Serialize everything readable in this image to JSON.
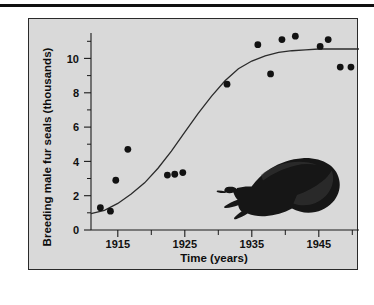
{
  "page": {
    "background_color": "#ffffff",
    "top_rule_color": "#101010",
    "panel_background": "#d9d9d9",
    "panel_border_color": "#2a2a2a"
  },
  "figure": {
    "name": "fur-seal-population-growth-figure",
    "decoration_label": "fur-seal-silhouette"
  },
  "chart_data": {
    "type": "scatter",
    "title": "",
    "subtitle": "",
    "xlabel": "Time (years)",
    "ylabel": "Breeding male fur seals (thousands)",
    "xlim": [
      1911,
      1951
    ],
    "ylim": [
      0,
      11.6
    ],
    "grid": false,
    "legend": null,
    "x_major_ticks": [
      1915,
      1925,
      1935,
      1945
    ],
    "x_major_tick_labels": [
      "1915",
      "1925",
      "1935",
      "1945"
    ],
    "x_minor_ticks": [
      1920,
      1930,
      1940,
      1950
    ],
    "y_major_ticks": [
      0,
      2,
      4,
      6,
      8,
      10
    ],
    "y_major_tick_labels": [
      "0",
      "2",
      "4",
      "6",
      "8",
      "10"
    ],
    "y_minor_ticks": [
      1,
      3,
      5,
      7,
      9,
      11
    ],
    "series": [
      {
        "name": "Breeding male fur seals (observed)",
        "type": "scatter",
        "marker": "filled-circle",
        "color": "#121212",
        "points": [
          {
            "x": 1912.4,
            "y": 1.3
          },
          {
            "x": 1913.9,
            "y": 1.1
          },
          {
            "x": 1914.7,
            "y": 2.9
          },
          {
            "x": 1916.5,
            "y": 4.7
          },
          {
            "x": 1922.4,
            "y": 3.2
          },
          {
            "x": 1923.5,
            "y": 3.25
          },
          {
            "x": 1924.7,
            "y": 3.35
          },
          {
            "x": 1931.3,
            "y": 8.5
          },
          {
            "x": 1935.9,
            "y": 10.8
          },
          {
            "x": 1937.8,
            "y": 9.1
          },
          {
            "x": 1939.5,
            "y": 11.1
          },
          {
            "x": 1941.5,
            "y": 11.3
          },
          {
            "x": 1945.2,
            "y": 10.7
          },
          {
            "x": 1946.4,
            "y": 11.1
          },
          {
            "x": 1948.2,
            "y": 9.5
          },
          {
            "x": 1949.8,
            "y": 9.5
          }
        ]
      },
      {
        "name": "Logistic growth fit",
        "type": "line",
        "color": "#2b2b2b",
        "x": [
          1911,
          1913,
          1915,
          1917,
          1919,
          1921,
          1923,
          1925,
          1927,
          1929,
          1931,
          1933,
          1935,
          1937,
          1939,
          1941,
          1943,
          1945,
          1947,
          1949,
          1951
        ],
        "y": [
          0.95,
          1.15,
          1.55,
          2.1,
          2.75,
          3.6,
          4.6,
          5.7,
          6.8,
          7.8,
          8.7,
          9.4,
          9.85,
          10.15,
          10.35,
          10.45,
          10.5,
          10.55,
          10.55,
          10.55,
          10.55
        ]
      }
    ]
  }
}
